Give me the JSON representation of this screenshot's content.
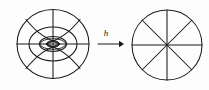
{
  "figure": {
    "caption_label": "h",
    "colors": {
      "background": "#fdfdfd",
      "ink": "#1a1a1a"
    },
    "source": {
      "name": "source-figure",
      "description": "annulus-with-curved-radial-lines",
      "center": {
        "x": 53,
        "y": 44
      },
      "outer_ellipse": {
        "rx": 36,
        "ry": 35
      },
      "middle_ellipse": {
        "rx": 24,
        "ry": 17
      },
      "inner_ellipse": {
        "rx": 13,
        "ry": 7
      },
      "core_ellipse": {
        "rx": 6,
        "ry": 3
      },
      "axis_lines": [
        "vertical-diameter",
        "horizontal-diameter"
      ],
      "curved_radial_count": 4
    },
    "target": {
      "name": "target-figure",
      "description": "circle-divided-into-eight-sectors",
      "center": {
        "x": 167,
        "y": 45
      },
      "radius": 35,
      "sector_count": 8,
      "diameter_count": 4,
      "diameter_angles_deg": [
        0,
        45,
        90,
        135
      ]
    },
    "arrow": {
      "name": "map-arrow",
      "x1": 98,
      "x2": 123,
      "y": 44,
      "label": "h",
      "label_x": 106,
      "label_y": 35
    }
  }
}
